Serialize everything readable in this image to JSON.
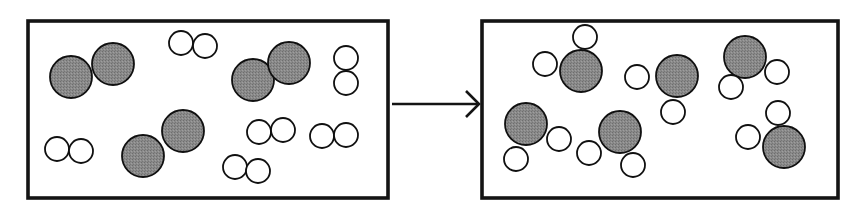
{
  "figure": {
    "type": "particulate-reaction-diagram",
    "background_color": "#ffffff",
    "outline_color": "#141414",
    "arrow": {
      "name": "reaction-arrow",
      "direction": "left-to-right",
      "x1": 392,
      "y1": 104,
      "x2": 479,
      "y2": 104,
      "head_size": 13,
      "color": "#141414"
    }
  },
  "legend": {
    "gray_atom": {
      "label": "large shaded atom",
      "fill": "#848484",
      "stroke": "#101010",
      "radius": 21
    },
    "white_atom": {
      "label": "small open atom",
      "fill": "#ffffff",
      "stroke": "#101010",
      "radius": 12
    }
  },
  "panels": [
    {
      "id": "reactants",
      "name": "reactant-box",
      "label": "Reactants",
      "box": {
        "x": 28,
        "y": 21,
        "width": 360,
        "height": 177
      },
      "counts": {
        "gray_diatomic_molecules": 4,
        "white_diatomic_molecules": 6,
        "total_molecules": 10,
        "gray_atoms": 8,
        "white_atoms": 12
      },
      "molecules": [
        {
          "name": "gray-diatomic-molecule",
          "type": "diatomic-gray",
          "atoms": [
            {
              "kind": "gray",
              "cx": 71,
              "cy": 77,
              "r": 21
            },
            {
              "kind": "gray",
              "cx": 113,
              "cy": 64,
              "r": 21
            }
          ]
        },
        {
          "name": "gray-diatomic-molecule",
          "type": "diatomic-gray",
          "atoms": [
            {
              "kind": "gray",
              "cx": 143,
              "cy": 156,
              "r": 21
            },
            {
              "kind": "gray",
              "cx": 183,
              "cy": 131,
              "r": 21
            }
          ]
        },
        {
          "name": "gray-diatomic-molecule",
          "type": "diatomic-gray",
          "atoms": [
            {
              "kind": "gray",
              "cx": 253,
              "cy": 80,
              "r": 21
            },
            {
              "kind": "gray",
              "cx": 289,
              "cy": 63,
              "r": 21
            }
          ]
        },
        {
          "name": "white-diatomic-molecule",
          "type": "diatomic-white",
          "atoms": [
            {
              "kind": "white",
              "cx": 181,
              "cy": 43,
              "r": 12
            },
            {
              "kind": "white",
              "cx": 205,
              "cy": 46,
              "r": 12
            }
          ]
        },
        {
          "name": "white-diatomic-molecule",
          "type": "diatomic-white",
          "atoms": [
            {
              "kind": "white",
              "cx": 57,
              "cy": 149,
              "r": 12
            },
            {
              "kind": "white",
              "cx": 81,
              "cy": 151,
              "r": 12
            }
          ]
        },
        {
          "name": "white-diatomic-molecule",
          "type": "diatomic-white",
          "atoms": [
            {
              "kind": "white",
              "cx": 346,
              "cy": 58,
              "r": 12
            },
            {
              "kind": "white",
              "cx": 346,
              "cy": 83,
              "r": 12
            }
          ]
        },
        {
          "name": "white-diatomic-molecule",
          "type": "diatomic-white",
          "atoms": [
            {
              "kind": "white",
              "cx": 259,
              "cy": 132,
              "r": 12
            },
            {
              "kind": "white",
              "cx": 283,
              "cy": 130,
              "r": 12
            }
          ]
        },
        {
          "name": "white-diatomic-molecule",
          "type": "diatomic-white",
          "atoms": [
            {
              "kind": "white",
              "cx": 322,
              "cy": 136,
              "r": 12
            },
            {
              "kind": "white",
              "cx": 346,
              "cy": 135,
              "r": 12
            }
          ]
        },
        {
          "name": "white-diatomic-molecule",
          "type": "diatomic-white",
          "atoms": [
            {
              "kind": "white",
              "cx": 235,
              "cy": 167,
              "r": 12
            },
            {
              "kind": "white",
              "cx": 258,
              "cy": 171,
              "r": 12
            }
          ]
        }
      ]
    },
    {
      "id": "products",
      "name": "product-box",
      "label": "Products",
      "box": {
        "x": 482,
        "y": 21,
        "width": 356,
        "height": 177
      },
      "counts": {
        "triatomic_molecules": 6,
        "total_molecules": 6,
        "gray_atoms": 6,
        "white_atoms": 12
      },
      "molecules": [
        {
          "name": "triatomic-product-molecule",
          "type": "triatomic",
          "atoms": [
            {
              "kind": "gray",
              "cx": 581,
              "cy": 71,
              "r": 21
            },
            {
              "kind": "white",
              "cx": 585,
              "cy": 37,
              "r": 12
            },
            {
              "kind": "white",
              "cx": 545,
              "cy": 64,
              "r": 12
            }
          ]
        },
        {
          "name": "triatomic-product-molecule",
          "type": "triatomic",
          "atoms": [
            {
              "kind": "gray",
              "cx": 677,
              "cy": 76,
              "r": 21
            },
            {
              "kind": "white",
              "cx": 637,
              "cy": 77,
              "r": 12
            },
            {
              "kind": "white",
              "cx": 673,
              "cy": 112,
              "r": 12
            }
          ]
        },
        {
          "name": "triatomic-product-molecule",
          "type": "triatomic",
          "atoms": [
            {
              "kind": "gray",
              "cx": 745,
              "cy": 57,
              "r": 21
            },
            {
              "kind": "white",
              "cx": 777,
              "cy": 72,
              "r": 12
            },
            {
              "kind": "white",
              "cx": 731,
              "cy": 87,
              "r": 12
            }
          ]
        },
        {
          "name": "triatomic-product-molecule",
          "type": "triatomic",
          "atoms": [
            {
              "kind": "gray",
              "cx": 526,
              "cy": 124,
              "r": 21
            },
            {
              "kind": "white",
              "cx": 559,
              "cy": 139,
              "r": 12
            },
            {
              "kind": "white",
              "cx": 516,
              "cy": 159,
              "r": 12
            }
          ]
        },
        {
          "name": "triatomic-product-molecule",
          "type": "triatomic",
          "atoms": [
            {
              "kind": "gray",
              "cx": 620,
              "cy": 132,
              "r": 21
            },
            {
              "kind": "white",
              "cx": 589,
              "cy": 153,
              "r": 12
            },
            {
              "kind": "white",
              "cx": 633,
              "cy": 165,
              "r": 12
            }
          ]
        },
        {
          "name": "triatomic-product-molecule",
          "type": "triatomic",
          "atoms": [
            {
              "kind": "gray",
              "cx": 784,
              "cy": 147,
              "r": 21
            },
            {
              "kind": "white",
              "cx": 778,
              "cy": 113,
              "r": 12
            },
            {
              "kind": "white",
              "cx": 748,
              "cy": 137,
              "r": 12
            }
          ]
        }
      ]
    }
  ]
}
